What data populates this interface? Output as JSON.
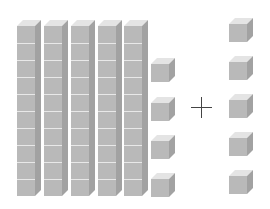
{
  "diagram": {
    "left_group": {
      "ten_rods": 5,
      "cubes_per_rod": 10,
      "unit_cubes": 4,
      "value": 54
    },
    "operator": "+",
    "right_group": {
      "unit_cubes": 5,
      "value": 5
    },
    "colors": {
      "top_face": "#e4e4e4",
      "front_face": "#b9b9b9",
      "side_face": "#a2a2a2",
      "operator": "#444444",
      "background": "#ffffff"
    }
  }
}
